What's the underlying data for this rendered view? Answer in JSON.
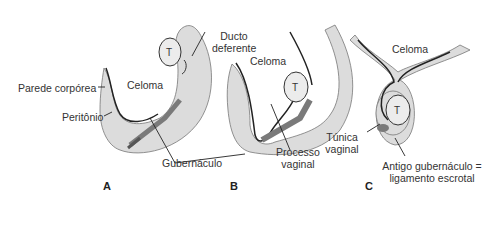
{
  "figure": {
    "panels": [
      {
        "id": "A",
        "label": "A"
      },
      {
        "id": "B",
        "label": "B"
      },
      {
        "id": "C",
        "label": "C"
      }
    ],
    "labels": {
      "parede_corporea": "Parede corpórea",
      "peritonio": "Peritônio",
      "celoma_a": "Celoma",
      "ducto_line1": "Ducto",
      "ducto_line2": "deferente",
      "celoma_b": "Celoma",
      "gubernaculo": "Gubernáculo",
      "processo_line1": "Processo",
      "processo_line2": "vaginal",
      "celoma_c": "Celoma",
      "tunica_line1": "Túnica",
      "tunica_line2": "vaginal",
      "antigo_line1": "Antigo gubernáculo =",
      "antigo_line2": "ligamento escrotal",
      "testis": "T"
    },
    "colors": {
      "wall": "#dcdcdc",
      "line": "#222222",
      "gubernaculum": "#7a7a7a",
      "testis": "#e8e8e8"
    }
  }
}
